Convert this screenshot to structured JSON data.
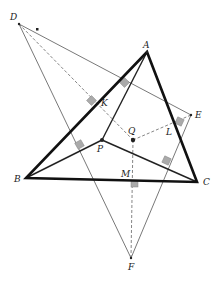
{
  "diagram": {
    "type": "geometry-figure",
    "points": {
      "A": {
        "label": "A",
        "x": 147,
        "y": 52
      },
      "B": {
        "label": "B",
        "x": 26,
        "y": 178
      },
      "C": {
        "label": "C",
        "x": 197,
        "y": 182
      },
      "D": {
        "label": "D",
        "x": 19,
        "y": 24
      },
      "E": {
        "label": "E",
        "x": 191,
        "y": 115
      },
      "F": {
        "label": "F",
        "x": 131,
        "y": 258
      },
      "P": {
        "label": "P",
        "x": 102,
        "y": 140
      },
      "Q": {
        "label": "Q",
        "x": 133,
        "y": 140
      },
      "K": {
        "label": "K",
        "x": 116,
        "y": 97
      },
      "L": {
        "label": "L",
        "x": 172,
        "y": 127
      },
      "M": {
        "label": "M",
        "x": 131,
        "y": 181
      }
    },
    "labels": [
      "A",
      "B",
      "C",
      "D",
      "E",
      "F",
      "P",
      "Q",
      "K",
      "L",
      "M"
    ],
    "colors": {
      "thick_line": "#111111",
      "thin_line": "#555555",
      "dashed_line": "#666666",
      "right_angle_marker": "#aaaaaa",
      "background": "#ffffff"
    }
  }
}
